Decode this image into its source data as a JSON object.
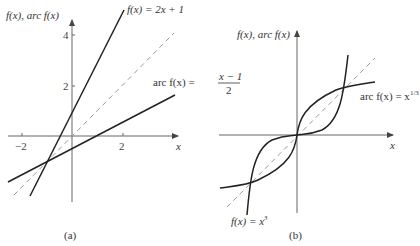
{
  "figure": {
    "panels": [
      {
        "id": "a",
        "caption": "(a)",
        "y_axis_label": "f(x), arc f(x)",
        "x_axis_label": "x",
        "x_ticks": [
          "−2",
          "2"
        ],
        "y_ticks": [
          "4",
          "2"
        ],
        "curves": [
          {
            "name": "f(x) = 2x + 1",
            "label": "f(x) = 2x + 1",
            "style": "solid"
          },
          {
            "name": "arc f(x) = (x − 1)/2",
            "label_prefix": "arc f(x) =",
            "numerator": "x − 1",
            "denominator": "2",
            "style": "solid"
          },
          {
            "name": "y = x",
            "style": "dashed"
          }
        ]
      },
      {
        "id": "b",
        "caption": "(b)",
        "y_axis_label": "f(x), arc f(x)",
        "x_axis_label": "x",
        "curves": [
          {
            "name": "f(x) = x^3",
            "label": "f(x) = x",
            "exponent": "3",
            "style": "solid"
          },
          {
            "name": "arc f(x) = x^(1/3)",
            "label": "arc f(x) = x",
            "exponent": "1/3",
            "style": "solid"
          },
          {
            "name": "y = x",
            "style": "dashed"
          }
        ]
      }
    ]
  },
  "colors": {
    "curve": "#222222",
    "axis": "#555555",
    "dashed": "#999999"
  }
}
